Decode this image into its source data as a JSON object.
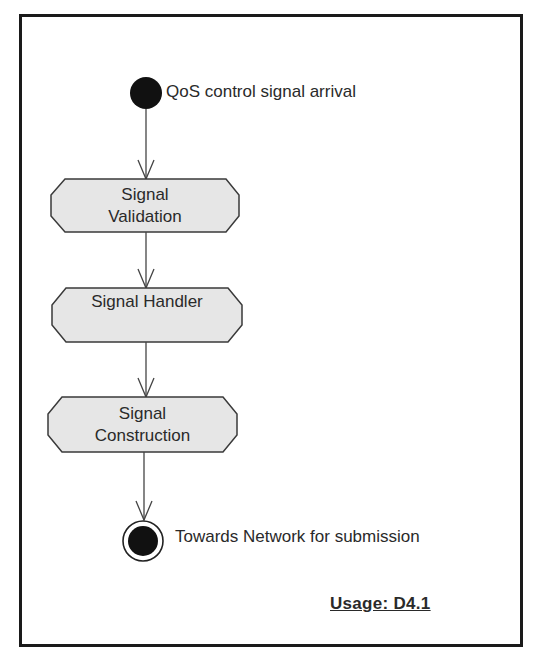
{
  "diagram": {
    "type": "uml-activity",
    "start": {
      "label": "QoS control signal arrival"
    },
    "activities": [
      {
        "id": "validation",
        "lines": [
          "Signal",
          "Validation"
        ]
      },
      {
        "id": "handler",
        "lines": [
          "Signal Handler"
        ]
      },
      {
        "id": "construction",
        "lines": [
          "Signal",
          "Construction"
        ]
      }
    ],
    "end": {
      "label": "Towards Network for submission"
    },
    "edges": [
      [
        "start",
        "validation"
      ],
      [
        "validation",
        "handler"
      ],
      [
        "handler",
        "construction"
      ],
      [
        "construction",
        "end"
      ]
    ],
    "footer": {
      "usage": "Usage: D4.1"
    },
    "colors": {
      "frame": "#1a1a1a",
      "node_fill": "#e6e6e6",
      "node_stroke": "#3a3a3a",
      "start_fill": "#111111",
      "line": "#444444"
    }
  }
}
